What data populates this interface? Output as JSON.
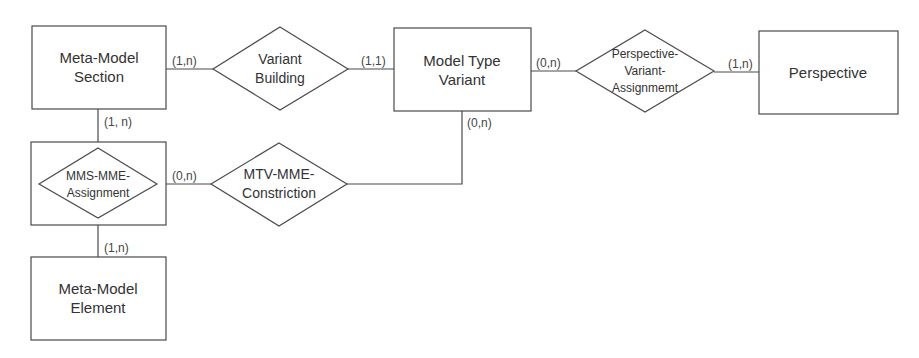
{
  "diagram": {
    "type": "entity-relationship",
    "colors": {
      "stroke": "#4a4a4a",
      "text": "#333333",
      "background": "#ffffff"
    },
    "entities": [
      {
        "id": "mms",
        "lines": [
          "Meta-Model",
          "Section"
        ]
      },
      {
        "id": "mtv",
        "lines": [
          "Model Type",
          "Variant"
        ]
      },
      {
        "id": "persp",
        "lines": [
          "Perspective"
        ]
      },
      {
        "id": "mme",
        "lines": [
          "Meta-Model",
          "Element"
        ]
      }
    ],
    "relationships": [
      {
        "id": "vb",
        "lines": [
          "Variant",
          "Building"
        ]
      },
      {
        "id": "pva",
        "lines": [
          "Perspective-",
          "Variant-",
          "Assignmemt"
        ]
      },
      {
        "id": "mmsmme",
        "lines": [
          "MMS-MME-",
          "Assignment"
        ],
        "aggregated": true
      },
      {
        "id": "mtvmme",
        "lines": [
          "MTV-MME-",
          "Constriction"
        ]
      }
    ],
    "cardinalities": {
      "mms_vb": "(1,n)",
      "vb_mtv": "(1,1)",
      "mtv_pva": "(0,n)",
      "pva_persp": "(1,n)",
      "mms_mmsmme": "(1, n)",
      "mmsmme_mtvmme": "(0,n)",
      "mtv_mtvmme": "(0,n)",
      "mmsmme_mme": "(1,n)"
    }
  }
}
